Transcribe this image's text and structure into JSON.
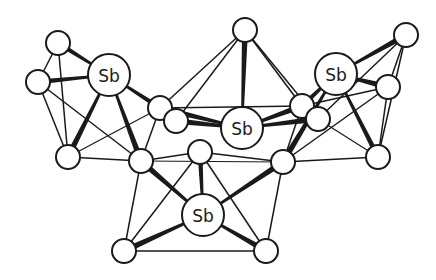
{
  "diagram": {
    "type": "cluster-structure",
    "colors": {
      "line": "#1a1a1a",
      "atom_fill": "#ffffff",
      "background": "#ffffff"
    },
    "atoms": [
      {
        "id": "Sb1",
        "label": "Sb",
        "x": 109,
        "y": 75,
        "r": 21
      },
      {
        "id": "Sb2",
        "label": "Sb",
        "x": 242,
        "y": 128,
        "r": 21
      },
      {
        "id": "Sb3",
        "label": "Sb",
        "x": 336,
        "y": 74,
        "r": 21
      },
      {
        "id": "Sb4",
        "label": "Sb",
        "x": 203,
        "y": 215,
        "r": 21
      },
      {
        "id": "a1",
        "label": "",
        "x": 58,
        "y": 43,
        "r": 12
      },
      {
        "id": "a2",
        "label": "",
        "x": 38,
        "y": 82,
        "r": 12
      },
      {
        "id": "a3",
        "label": "",
        "x": 160,
        "y": 108,
        "r": 12
      },
      {
        "id": "a3b",
        "label": "",
        "x": 176,
        "y": 121,
        "r": 12
      },
      {
        "id": "a4",
        "label": "",
        "x": 68,
        "y": 157,
        "r": 12
      },
      {
        "id": "a5",
        "label": "",
        "x": 141,
        "y": 161,
        "r": 12
      },
      {
        "id": "a6",
        "label": "",
        "x": 200,
        "y": 152,
        "r": 12
      },
      {
        "id": "a7",
        "label": "",
        "x": 283,
        "y": 162,
        "r": 12
      },
      {
        "id": "a8",
        "label": "",
        "x": 302,
        "y": 106,
        "r": 12
      },
      {
        "id": "a8b",
        "label": "",
        "x": 318,
        "y": 119,
        "r": 12
      },
      {
        "id": "top",
        "label": "",
        "x": 245,
        "y": 30,
        "r": 12
      },
      {
        "id": "a9",
        "label": "",
        "x": 406,
        "y": 35,
        "r": 12
      },
      {
        "id": "a10",
        "label": "",
        "x": 388,
        "y": 87,
        "r": 12
      },
      {
        "id": "a11",
        "label": "",
        "x": 378,
        "y": 157,
        "r": 12
      },
      {
        "id": "b1",
        "label": "",
        "x": 124,
        "y": 251,
        "r": 12
      },
      {
        "id": "b2",
        "label": "",
        "x": 266,
        "y": 251,
        "r": 12
      }
    ],
    "bonds": [
      [
        "a1",
        "a2",
        1.5
      ],
      [
        "a1",
        "a4",
        1.5
      ],
      [
        "a2",
        "a4",
        1.5
      ],
      [
        "a2",
        "a5",
        1.5
      ],
      [
        "a1",
        "a3",
        0
      ],
      [
        "a4",
        "a5",
        1.5
      ],
      [
        "a4",
        "a3",
        1.2
      ],
      [
        "a3",
        "a5",
        1.5
      ],
      [
        "a3",
        "top",
        1.5
      ],
      [
        "a3b",
        "top",
        1.5
      ],
      [
        "a3",
        "a8",
        1.5
      ],
      [
        "top",
        "a8",
        1.5
      ],
      [
        "top",
        "a8b",
        1.5
      ],
      [
        "a8",
        "a7",
        1.5
      ],
      [
        "a8",
        "a10",
        1.5
      ],
      [
        "a8b",
        "a9",
        1.5
      ],
      [
        "a10",
        "a9",
        1.5
      ],
      [
        "a10",
        "a11",
        1.5
      ],
      [
        "a9",
        "a11",
        1.5
      ],
      [
        "a7",
        "a11",
        1.5
      ],
      [
        "a8b",
        "a11",
        1.2
      ],
      [
        "a7",
        "a10",
        1.5
      ],
      [
        "a5",
        "a6",
        1.5
      ],
      [
        "a6",
        "a7",
        1.5
      ],
      [
        "a5",
        "a7",
        1.2
      ],
      [
        "a5",
        "b1",
        1.5
      ],
      [
        "a6",
        "b1",
        1.5
      ],
      [
        "a6",
        "b2",
        1.5
      ],
      [
        "a7",
        "b2",
        1.5
      ],
      [
        "b1",
        "b2",
        1.5
      ]
    ],
    "wedges": [
      [
        "Sb1",
        "a1",
        5
      ],
      [
        "Sb1",
        "a2",
        5
      ],
      [
        "Sb1",
        "a3",
        5
      ],
      [
        "Sb1",
        "a4",
        6
      ],
      [
        "Sb1",
        "a5",
        6
      ],
      [
        "Sb2",
        "top",
        6
      ],
      [
        "Sb2",
        "a3",
        6
      ],
      [
        "Sb2",
        "a3b",
        6
      ],
      [
        "Sb2",
        "a8",
        6
      ],
      [
        "Sb2",
        "a8b",
        6
      ],
      [
        "Sb3",
        "a9",
        6
      ],
      [
        "Sb3",
        "a10",
        6
      ],
      [
        "Sb3",
        "a7",
        6
      ],
      [
        "Sb3",
        "a11",
        5
      ],
      [
        "Sb3",
        "a8",
        5
      ],
      [
        "Sb4",
        "a5",
        6
      ],
      [
        "Sb4",
        "a6",
        5
      ],
      [
        "Sb4",
        "a7",
        6
      ],
      [
        "Sb4",
        "b1",
        6
      ],
      [
        "Sb4",
        "b2",
        6
      ]
    ]
  }
}
